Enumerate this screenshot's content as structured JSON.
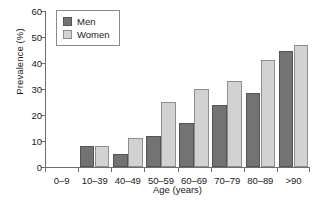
{
  "chart_data": {
    "type": "bar",
    "title": "",
    "xlabel": "Age (years)",
    "ylabel": "Prevalence (%)",
    "categories": [
      "0–9",
      "10–39",
      "40–49",
      "50–59",
      "60–69",
      "70–79",
      "80–89",
      ">90"
    ],
    "series": [
      {
        "name": "Men",
        "color": "#737373",
        "values": [
          0,
          8,
          5,
          12,
          17,
          24,
          28.5,
          44.5
        ]
      },
      {
        "name": "Women",
        "color": "#d2d2d2",
        "values": [
          0,
          8,
          11,
          25,
          30,
          33,
          41,
          47
        ]
      }
    ],
    "ylim": [
      0,
      60
    ],
    "yticks": [
      0,
      10,
      20,
      30,
      40,
      50,
      60
    ],
    "ytick_labels": [
      "0",
      "10",
      "20",
      "30",
      "40",
      "50",
      "60"
    ],
    "grid": false,
    "legend_position": "top-left",
    "legend_entries": [
      "Men",
      "Women"
    ]
  }
}
